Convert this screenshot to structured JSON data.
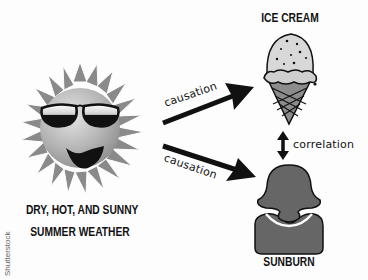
{
  "diagram": {
    "nodes": {
      "weather": {
        "label_line1": "DRY, HOT, AND SUNNY",
        "label_line2": "SUMMER WEATHER",
        "icon": "sun-with-sunglasses-icon"
      },
      "ice_cream": {
        "label": "ICE CREAM",
        "icon": "ice-cream-cone-icon"
      },
      "sunburn": {
        "label": "SUNBURN",
        "icon": "person-silhouette-icon"
      }
    },
    "edges": [
      {
        "from": "weather",
        "to": "ice_cream",
        "label": "causation",
        "type": "directed"
      },
      {
        "from": "weather",
        "to": "sunburn",
        "label": "causation",
        "type": "directed"
      },
      {
        "from": "ice_cream",
        "to": "sunburn",
        "label": "correlation",
        "type": "bidirectional"
      }
    ]
  },
  "watermark": "Shutterstock",
  "colors": {
    "background": "#fdfdfd",
    "ink": "#111111",
    "sun_body": "#b8b8b8",
    "sun_rays": "#8a8a8a",
    "person_fill": "#666666",
    "cone_fill": "#8c8c8c",
    "scoop_fill": "#d8d8d8"
  }
}
